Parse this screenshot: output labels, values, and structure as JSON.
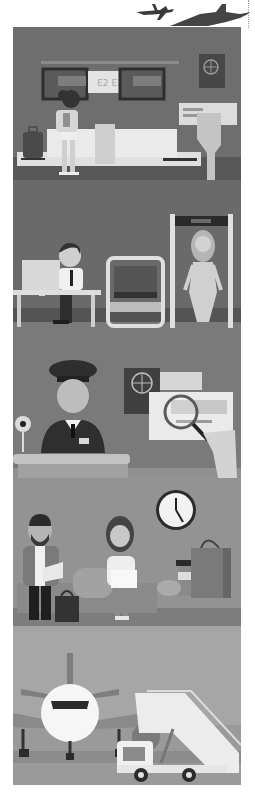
{
  "header": {
    "icons": [
      "airplane-icon",
      "airplane-shadow-icon"
    ]
  },
  "panels": [
    {
      "id": "check-in",
      "label": "Check-in counter",
      "display_text": "E2 E3",
      "bg": "#6e6e6e",
      "floor": "#575757"
    },
    {
      "id": "security",
      "label": "Security screening",
      "bg": "#6a6a6a",
      "floor": "#545454"
    },
    {
      "id": "passport-control",
      "label": "Passport control",
      "bg": "#7a7a7a",
      "floor": "#909090"
    },
    {
      "id": "waiting-lounge",
      "label": "Waiting lounge",
      "clock_time": "5:00",
      "bg": "#939393",
      "floor": "#7d7d7d"
    },
    {
      "id": "boarding",
      "label": "Boarding",
      "bg": "#a6a6a6",
      "floor": "#8f8f8f"
    }
  ],
  "colors": {
    "dark": "#333333",
    "light": "#e6e6e6",
    "white": "#fafafa",
    "mid": "#8a8a8a"
  }
}
